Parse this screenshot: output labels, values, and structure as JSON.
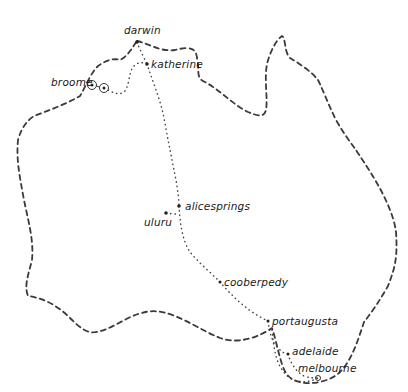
{
  "map": {
    "title": "Hand-drawn route map of Australia",
    "style": {
      "line_color": "#3a3a3a",
      "background": "#ffffff"
    },
    "cities": [
      {
        "id": "darwin",
        "label": "darwin",
        "x": 137,
        "y": 40,
        "lx": 126,
        "ly": 32
      },
      {
        "id": "katherine",
        "label": "katherine",
        "x": 147,
        "y": 64,
        "lx": 152,
        "ly": 68
      },
      {
        "id": "broome",
        "label": "broome",
        "x": 92,
        "y": 85,
        "lx": 51,
        "ly": 84
      },
      {
        "id": "alicesprings",
        "label": "alicesprings",
        "x": 179,
        "y": 206,
        "lx": 185,
        "ly": 208
      },
      {
        "id": "uluru",
        "label": "uluru",
        "x": 166,
        "y": 213,
        "lx": 144,
        "ly": 225
      },
      {
        "id": "cooberpedy",
        "label": "cooberpedy",
        "x": 220,
        "y": 282,
        "lx": 225,
        "ly": 285
      },
      {
        "id": "portaugusta",
        "label": "portaugusta",
        "x": 268,
        "y": 321,
        "lx": 273,
        "ly": 324
      },
      {
        "id": "adelaide",
        "label": "adelaide",
        "x": 288,
        "y": 354,
        "lx": 292,
        "ly": 354
      },
      {
        "id": "melbourne",
        "label": "melbourne",
        "x": 318,
        "y": 378,
        "lx": 298,
        "ly": 370
      }
    ]
  }
}
